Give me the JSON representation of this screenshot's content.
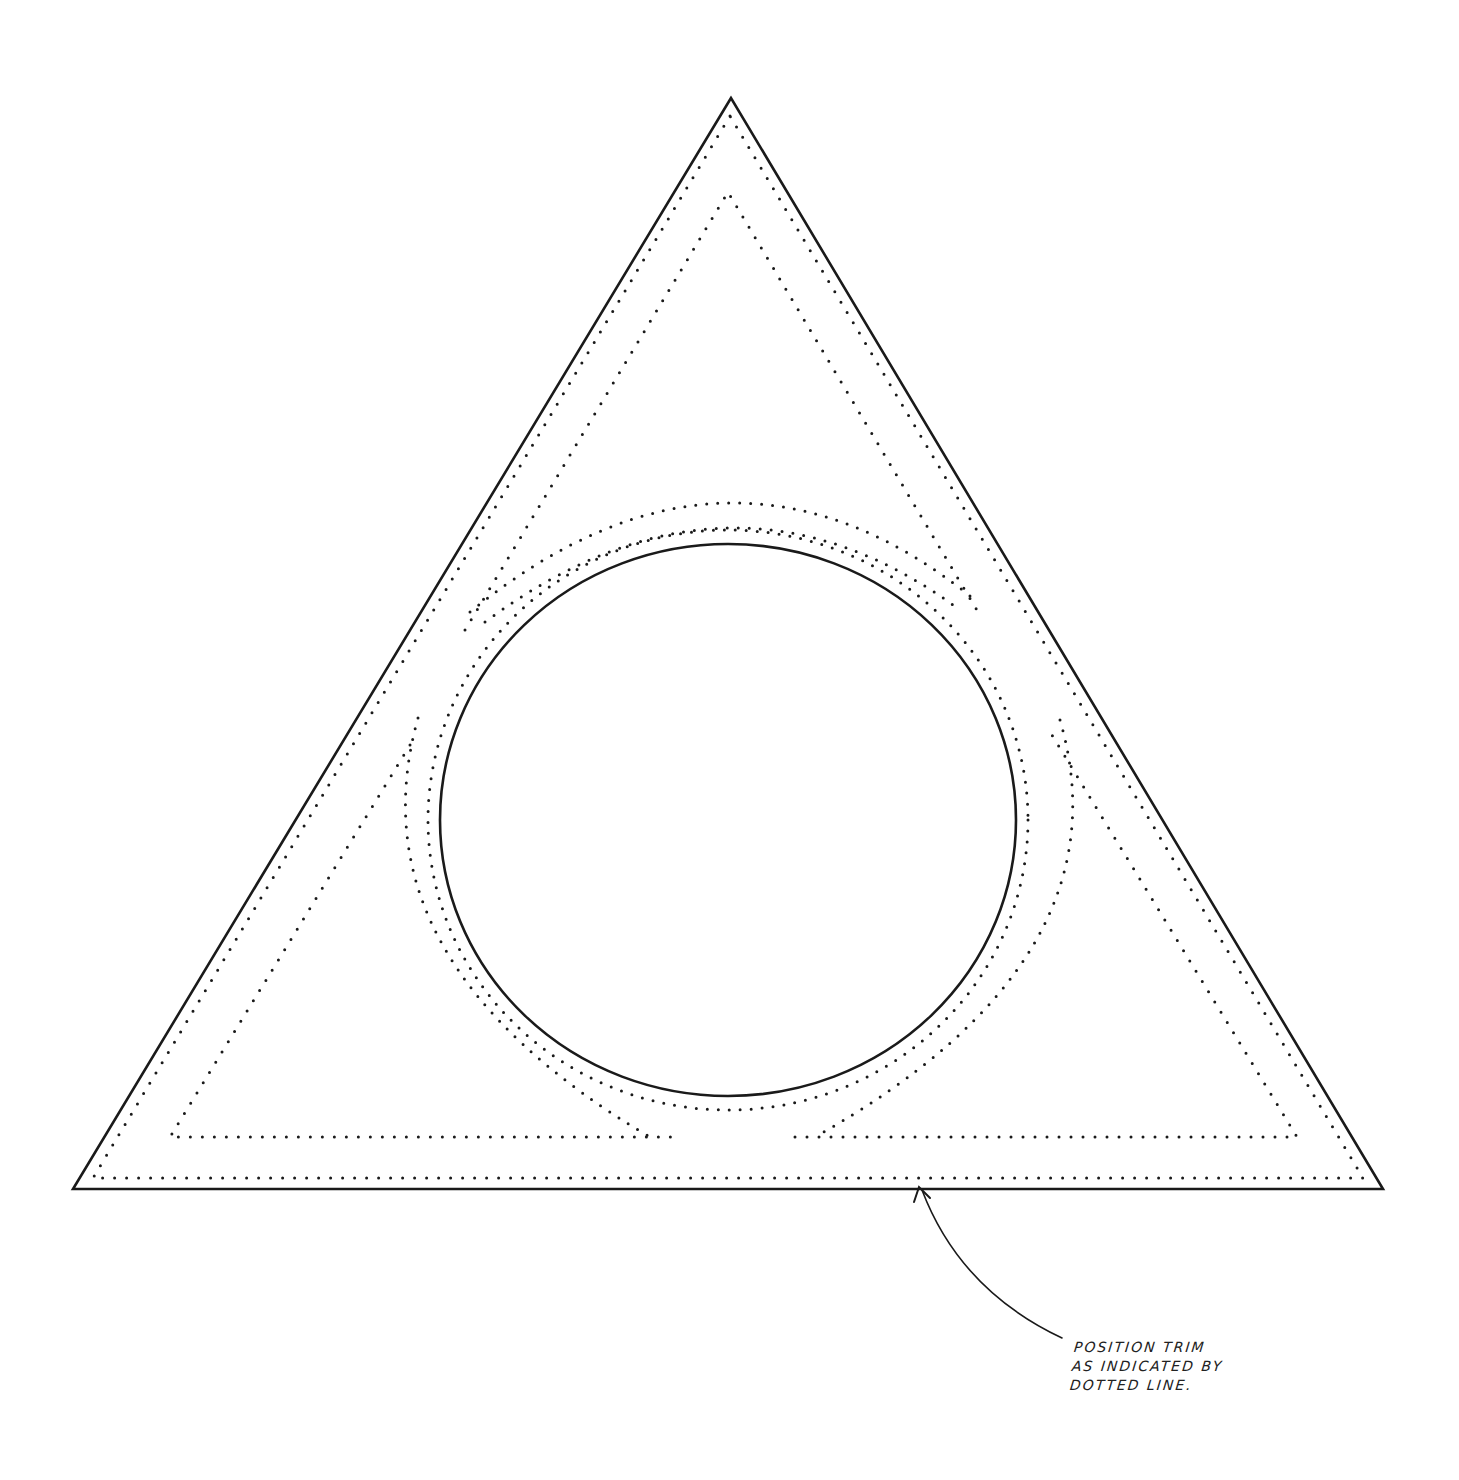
{
  "diagram": {
    "colors": {
      "line": "#1a1a1a",
      "background": "#ffffff"
    },
    "outer_triangle": {
      "apex": [
        731,
        98
      ],
      "left": [
        73,
        1189
      ],
      "right": [
        1383,
        1189
      ]
    },
    "circle": {
      "cx": 728,
      "cy": 820,
      "rx": 288,
      "ry": 276
    },
    "annotation": {
      "lines": [
        "POSITION TRIM",
        "AS INDICATED BY",
        "DOTTED LINE."
      ],
      "arrow_tip": [
        918,
        1187
      ]
    }
  }
}
